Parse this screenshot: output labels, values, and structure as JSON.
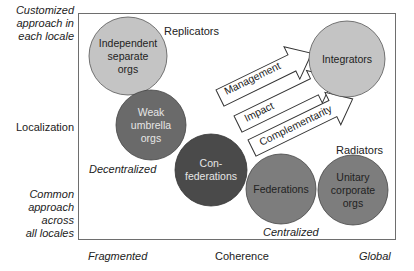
{
  "y_axis": {
    "top_label": [
      "Customized",
      "approach in",
      "each locale"
    ],
    "middle_label": "Localization",
    "bottom_label": [
      "Common",
      "approach",
      "across",
      "all locales"
    ]
  },
  "x_axis": {
    "left_label": "Fragmented",
    "middle_label": "Coherence",
    "right_label": "Global"
  },
  "region_labels": {
    "replicators": "Replicators",
    "radiators": "Radiators",
    "decentralized": "Decentralized",
    "centralized": "Centralized"
  },
  "circles": [
    {
      "id": "independent",
      "lines": [
        "Independent",
        "separate",
        "orgs"
      ],
      "fill": "#c4c4c4",
      "text_color": "#222222"
    },
    {
      "id": "weak-umbrella",
      "lines": [
        "Weak",
        "umbrella",
        "orgs"
      ],
      "fill": "#6a6a6a",
      "text_color": "#e6e6e6"
    },
    {
      "id": "confederations",
      "lines": [
        "Con-",
        "federations"
      ],
      "fill": "#4a4a4a",
      "text_color": "#e6e6e6"
    },
    {
      "id": "federations",
      "lines": [
        "Federations"
      ],
      "fill": "#7d7d7d",
      "text_color": "#222222"
    },
    {
      "id": "unitary",
      "lines": [
        "Unitary",
        "corporate",
        "orgs"
      ],
      "fill": "#7d7d7d",
      "text_color": "#222222"
    },
    {
      "id": "integrators",
      "lines": [
        "Integrators"
      ],
      "fill": "#c4c4c4",
      "text_color": "#222222"
    }
  ],
  "arrows": [
    {
      "label": "Management"
    },
    {
      "label": "Impact"
    },
    {
      "label": "Complementarity"
    }
  ]
}
